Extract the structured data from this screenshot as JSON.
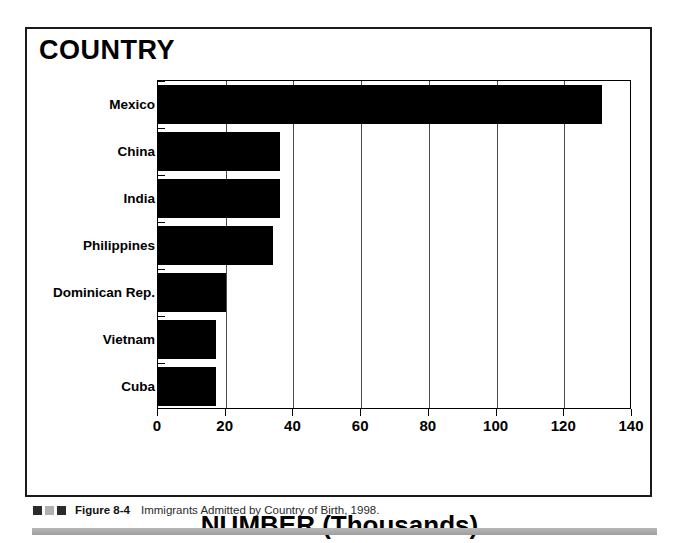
{
  "figure": {
    "y_axis_title": "COUNTRY",
    "x_axis_title": "NUMBER (Thousands)",
    "caption_figure_number": "Figure 8-4",
    "caption_text": "Immigrants Admitted by Country of Birth, 1998.",
    "swatch_colors": [
      "#2b2b2b",
      "#b0b0b0",
      "#2b2b2b"
    ],
    "bar_color": "#000000",
    "frame_color": "#1a1a1a",
    "background_color": "#ffffff"
  },
  "chart_data": {
    "type": "bar",
    "orientation": "horizontal",
    "title": "COUNTRY",
    "xlabel": "NUMBER (Thousands)",
    "ylabel": "COUNTRY",
    "xlim": [
      0,
      140
    ],
    "xticks": [
      0,
      20,
      40,
      60,
      80,
      100,
      120,
      140
    ],
    "xtick_labels": [
      "0",
      "20",
      "40",
      "60",
      "80",
      "100",
      "120",
      "140"
    ],
    "grid": true,
    "legend": false,
    "categories": [
      "Mexico",
      "China",
      "India",
      "Philippines",
      "Dominican Rep.",
      "Vietnam",
      "Cuba"
    ],
    "values": [
      131,
      36,
      36,
      34,
      20,
      17,
      17
    ],
    "series": [
      {
        "name": "Immigrants admitted (thousands)",
        "values": [
          131,
          36,
          36,
          34,
          20,
          17,
          17
        ]
      }
    ]
  }
}
